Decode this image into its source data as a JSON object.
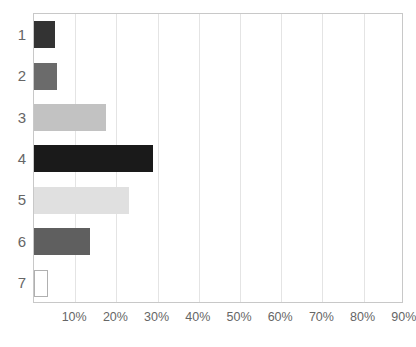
{
  "chart_data": {
    "type": "bar",
    "orientation": "horizontal",
    "title": "",
    "title_visible": false,
    "title_note": "title is cropped off the top edge of the screenshot",
    "xlabel": "",
    "ylabel": "",
    "categories": [
      "1",
      "2",
      "3",
      "4",
      "5",
      "6",
      "7"
    ],
    "values": [
      5.0,
      5.5,
      17.5,
      29.0,
      23.0,
      13.5,
      3.5
    ],
    "value_unit": "%",
    "xlim": [
      0,
      100
    ],
    "xticks": [
      10,
      20,
      30,
      40,
      50,
      60,
      70,
      80,
      90
    ],
    "xtick_labels": [
      "10%",
      "20%",
      "30%",
      "40%",
      "50%",
      "60%",
      "70%",
      "80%",
      "90%"
    ],
    "grid": true,
    "grid_axis": "x",
    "legend": false,
    "bar_colors": [
      "#333333",
      "#6b6b6b",
      "#c2c2c2",
      "#1a1a1a",
      "#e0e0e0",
      "#5f5f5f",
      "#ffffff"
    ],
    "bar_edge_colors": [
      "#333333",
      "#6b6b6b",
      "#c2c2c2",
      "#1a1a1a",
      "#e0e0e0",
      "#5f5f5f",
      "#b0b0b0"
    ]
  },
  "axes": {
    "frame_color": "#c8c8c8",
    "gridline_color": "#e4e4e4",
    "tick_label_color": "#666666",
    "category_label_color": "#666666"
  }
}
